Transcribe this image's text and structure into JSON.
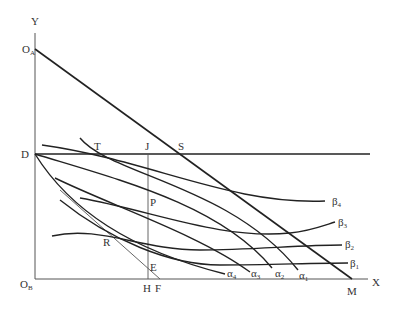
{
  "diagram": {
    "type": "edgeworth-box-style contract diagram",
    "axes": {
      "y_label": "Y",
      "x_label": "X",
      "origin_a": {
        "main": "O",
        "sub": "A"
      },
      "origin_b": {
        "main": "O",
        "sub": "B"
      }
    },
    "points": {
      "D": "D",
      "T": "T",
      "J": "J",
      "S": "S",
      "P": "P",
      "R": "R",
      "E": "E",
      "H": "H",
      "F": "F",
      "M": "M"
    },
    "alpha_curves": [
      {
        "main": "α",
        "sub": "4"
      },
      {
        "main": "α",
        "sub": "3"
      },
      {
        "main": "α",
        "sub": "2"
      },
      {
        "main": "α",
        "sub": "1"
      }
    ],
    "beta_curves": [
      {
        "main": "β",
        "sub": "4"
      },
      {
        "main": "β",
        "sub": "3"
      },
      {
        "main": "β",
        "sub": "2"
      },
      {
        "main": "β",
        "sub": "1"
      }
    ],
    "colors": {
      "line": "#222222",
      "axis": "#555555",
      "text": "#333333",
      "background": "#ffffff"
    }
  }
}
